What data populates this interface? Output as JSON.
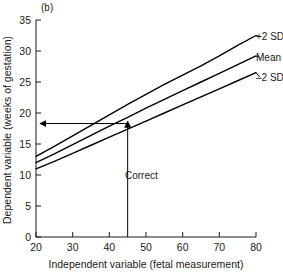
{
  "figure": {
    "panel_label": "(b)",
    "background_color": "#ffffff",
    "line_color": "#000000"
  },
  "chart_data": {
    "type": "line",
    "title": "",
    "subtitle": "",
    "xlabel": "Independent variable (fetal measurement)",
    "ylabel": "Dependent variable (weeks of gestation)",
    "xlim": [
      20,
      80
    ],
    "ylim": [
      0,
      35
    ],
    "xticks": [
      20,
      30,
      40,
      50,
      60,
      70,
      80
    ],
    "xticklabels": [
      "20",
      "30",
      "40",
      "50",
      "60",
      "70",
      "80"
    ],
    "yticks": [
      0,
      5,
      10,
      15,
      20,
      25,
      30,
      35
    ],
    "yticklabels": [
      "0",
      "5",
      "10",
      "15",
      "20",
      "25",
      "30",
      "35"
    ],
    "grid": false,
    "legend_position": "right-inline-labels",
    "x": [
      20,
      25,
      30,
      35,
      40,
      45,
      50,
      55,
      60,
      65,
      70,
      75,
      80
    ],
    "series": [
      {
        "name": "+2 SD",
        "label": "+2 SD",
        "values": [
          13.0,
          14.6,
          16.3,
          18.0,
          19.7,
          21.4,
          23.0,
          24.6,
          26.1,
          27.6,
          29.2,
          30.9,
          32.5
        ]
      },
      {
        "name": "Mean",
        "label": "Mean",
        "values": [
          12.0,
          13.4,
          14.9,
          16.4,
          17.9,
          19.3,
          20.8,
          22.2,
          23.6,
          25.0,
          26.4,
          27.8,
          29.2
        ]
      },
      {
        "name": "-2 SD",
        "label": "–2 SD",
        "values": [
          11.0,
          12.2,
          13.5,
          14.8,
          16.1,
          17.4,
          18.7,
          20.0,
          21.3,
          22.6,
          23.9,
          25.2,
          26.5
        ]
      }
    ],
    "annotations": [
      {
        "name": "measurement-readout",
        "label": "Correct",
        "x_value": 45,
        "y_value": 18.3,
        "description": "Vertical arrow from x-axis at 45 up to the Mean curve, then horizontal arrow left to the y-axis at about 18.3 weeks"
      }
    ]
  }
}
